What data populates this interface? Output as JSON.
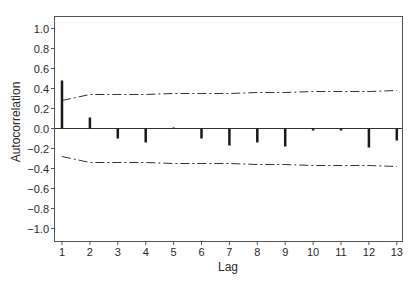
{
  "chart_data": {
    "type": "bar",
    "subtype": "autocorrelation-stem",
    "title": "",
    "xlabel": "Lag",
    "ylabel": "Autocorrelation",
    "x": [
      1,
      2,
      3,
      4,
      5,
      6,
      7,
      8,
      9,
      10,
      11,
      12,
      13
    ],
    "x_tick_labels": [
      "1",
      "2",
      "3",
      "4",
      "5",
      "6",
      "7",
      "8",
      "9",
      "10",
      "11",
      "12",
      "13"
    ],
    "y_tick_values": [
      1.0,
      0.8,
      0.6,
      0.4,
      0.2,
      0.0,
      -0.2,
      -0.4,
      -0.6,
      -0.8,
      -1.0
    ],
    "y_tick_labels": [
      "1.0",
      "0.8",
      "0.6",
      "0.4",
      "0.2",
      "0.0",
      "−0.2",
      "−0.4",
      "−0.6",
      "−0.8",
      "−1.0"
    ],
    "ylim": [
      -1.1,
      1.12
    ],
    "xlim": [
      0.75,
      13.2
    ],
    "grid": false,
    "legend": null,
    "series": [
      {
        "name": "Autocorrelation",
        "style": "stem",
        "color": "#1a1a1a",
        "values": [
          0.48,
          0.11,
          -0.1,
          -0.14,
          0.01,
          -0.1,
          -0.17,
          -0.14,
          -0.18,
          -0.02,
          -0.02,
          -0.19,
          -0.12
        ]
      },
      {
        "name": "Upper confidence limit",
        "style": "dash-dot",
        "color": "#333333",
        "values": [
          0.28,
          0.34,
          0.34,
          0.34,
          0.35,
          0.35,
          0.35,
          0.36,
          0.36,
          0.37,
          0.37,
          0.37,
          0.38
        ]
      },
      {
        "name": "Lower confidence limit",
        "style": "dash-dot",
        "color": "#333333",
        "values": [
          -0.28,
          -0.34,
          -0.34,
          -0.34,
          -0.35,
          -0.35,
          -0.35,
          -0.36,
          -0.36,
          -0.37,
          -0.37,
          -0.37,
          -0.38
        ]
      }
    ]
  }
}
